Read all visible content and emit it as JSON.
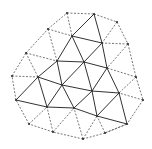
{
  "diagram": {
    "type": "triangular-mesh",
    "colors": {
      "solid_edge": "#333333",
      "dashed_edge": "#555555",
      "node": "#333333",
      "background": "#ffffff"
    },
    "nodes": {
      "A": [
        67,
        13
      ],
      "B": [
        94,
        14
      ],
      "C": [
        117,
        22
      ],
      "D": [
        128,
        44
      ],
      "E": [
        136,
        77
      ],
      "F": [
        143,
        100
      ],
      "G": [
        127,
        124
      ],
      "H": [
        105,
        133
      ],
      "I": [
        83,
        139
      ],
      "J": [
        53,
        132
      ],
      "K": [
        29,
        124
      ],
      "L": [
        16,
        100
      ],
      "M": [
        12,
        76
      ],
      "N": [
        26,
        53
      ],
      "O": [
        48,
        29
      ],
      "P": [
        72,
        36
      ],
      "Q": [
        102,
        43
      ],
      "R": [
        57,
        61
      ],
      "S": [
        84,
        62
      ],
      "T": [
        107,
        68
      ],
      "U": [
        38,
        77
      ],
      "V": [
        62,
        85
      ],
      "W": [
        92,
        91
      ],
      "X": [
        119,
        93
      ],
      "Y": [
        47,
        107
      ],
      "Z": [
        74,
        108
      ],
      "AA": [
        97,
        116
      ]
    },
    "solid_edges": [
      [
        "P",
        "B"
      ],
      [
        "P",
        "Q"
      ],
      [
        "B",
        "Q"
      ],
      [
        "P",
        "R"
      ],
      [
        "P",
        "S"
      ],
      [
        "Q",
        "S"
      ],
      [
        "Q",
        "T"
      ],
      [
        "R",
        "S"
      ],
      [
        "S",
        "T"
      ],
      [
        "R",
        "U"
      ],
      [
        "R",
        "V"
      ],
      [
        "S",
        "V"
      ],
      [
        "S",
        "W"
      ],
      [
        "T",
        "W"
      ],
      [
        "T",
        "X"
      ],
      [
        "U",
        "V"
      ],
      [
        "V",
        "W"
      ],
      [
        "W",
        "X"
      ],
      [
        "U",
        "L"
      ],
      [
        "U",
        "Y"
      ],
      [
        "V",
        "Y"
      ],
      [
        "V",
        "Z"
      ],
      [
        "W",
        "Z"
      ],
      [
        "W",
        "AA"
      ],
      [
        "X",
        "AA"
      ],
      [
        "X",
        "G"
      ],
      [
        "L",
        "Y"
      ],
      [
        "Y",
        "Z"
      ],
      [
        "Z",
        "AA"
      ],
      [
        "AA",
        "G"
      ]
    ],
    "dashed_edges": [
      [
        "A",
        "B"
      ],
      [
        "B",
        "C"
      ],
      [
        "C",
        "D"
      ],
      [
        "D",
        "E"
      ],
      [
        "E",
        "F"
      ],
      [
        "F",
        "G"
      ],
      [
        "G",
        "H"
      ],
      [
        "H",
        "I"
      ],
      [
        "I",
        "J"
      ],
      [
        "J",
        "K"
      ],
      [
        "K",
        "L"
      ],
      [
        "L",
        "M"
      ],
      [
        "M",
        "N"
      ],
      [
        "N",
        "O"
      ],
      [
        "O",
        "A"
      ],
      [
        "A",
        "P"
      ],
      [
        "O",
        "P"
      ],
      [
        "O",
        "R"
      ],
      [
        "N",
        "R"
      ],
      [
        "N",
        "U"
      ],
      [
        "M",
        "U"
      ],
      [
        "C",
        "Q"
      ],
      [
        "D",
        "Q"
      ],
      [
        "D",
        "T"
      ],
      [
        "E",
        "T"
      ],
      [
        "E",
        "X"
      ],
      [
        "F",
        "X"
      ],
      [
        "K",
        "Y"
      ],
      [
        "J",
        "Y"
      ],
      [
        "J",
        "Z"
      ],
      [
        "I",
        "Z"
      ],
      [
        "I",
        "AA"
      ],
      [
        "H",
        "AA"
      ],
      [
        "H",
        "G"
      ]
    ]
  }
}
